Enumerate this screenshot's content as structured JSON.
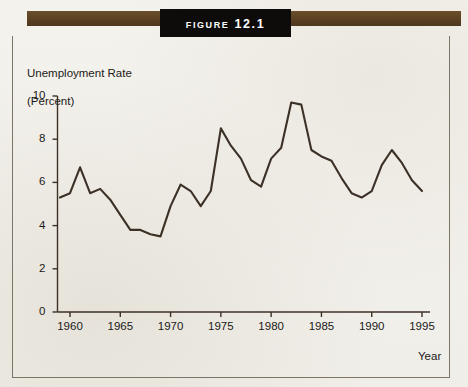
{
  "figure": {
    "banner_title": "Figure 12.1",
    "frame_color": "#7d7468",
    "bar_color": "#5a4022",
    "plate_color": "#0d0c0b"
  },
  "chart_data": {
    "type": "line",
    "title": "Figure 12.1",
    "xlabel": "Year",
    "ylabel": "Unemployment Rate\n(Percent)",
    "ylabel_line1": "Unemployment Rate",
    "ylabel_line2": "(Percent)",
    "line_color": "#3c3126",
    "grid": false,
    "legend": "none",
    "xlim": [
      1959,
      1995
    ],
    "ylim": [
      0,
      10
    ],
    "yticks": [
      0,
      2,
      4,
      6,
      8,
      10
    ],
    "ytick_labels": [
      "0",
      "2",
      "4",
      "6",
      "8",
      "10"
    ],
    "xticks": [
      1960,
      1965,
      1970,
      1975,
      1980,
      1985,
      1990,
      1995
    ],
    "xtick_labels": [
      "1960",
      "1965",
      "1970",
      "1975",
      "1980",
      "1985",
      "1990",
      "1995"
    ],
    "series": [
      {
        "name": "Unemployment Rate",
        "x": [
          1959,
          1960,
          1961,
          1962,
          1963,
          1964,
          1965,
          1966,
          1967,
          1968,
          1969,
          1970,
          1971,
          1972,
          1973,
          1974,
          1975,
          1976,
          1977,
          1978,
          1979,
          1980,
          1981,
          1982,
          1983,
          1984,
          1985,
          1986,
          1987,
          1988,
          1989,
          1990,
          1991,
          1992,
          1993,
          1994,
          1995
        ],
        "values": [
          5.3,
          5.5,
          6.7,
          5.5,
          5.7,
          5.2,
          4.5,
          3.8,
          3.8,
          3.6,
          3.5,
          4.9,
          5.9,
          5.6,
          4.9,
          5.6,
          8.5,
          7.7,
          7.1,
          6.1,
          5.8,
          7.1,
          7.6,
          9.7,
          9.6,
          7.5,
          7.2,
          7.0,
          6.2,
          5.5,
          5.3,
          5.6,
          6.8,
          7.5,
          6.9,
          6.1,
          5.6
        ]
      }
    ]
  }
}
